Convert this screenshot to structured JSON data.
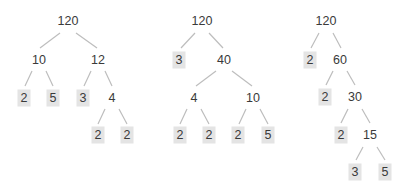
{
  "diagram": {
    "title": "",
    "leaf_box_color": "#e4e4e4",
    "edge_color": "#bdbdbd",
    "text_color": "#3a3a3a",
    "trees": [
      {
        "id": "tree-1",
        "nodes": [
          {
            "id": "t1n0",
            "label": "120",
            "x": 68,
            "y": 21,
            "leaf": false
          },
          {
            "id": "t1n1",
            "label": "10",
            "x": 39,
            "y": 60,
            "leaf": false
          },
          {
            "id": "t1n2",
            "label": "12",
            "x": 98,
            "y": 60,
            "leaf": false
          },
          {
            "id": "t1n3",
            "label": "2",
            "x": 24,
            "y": 98,
            "leaf": true
          },
          {
            "id": "t1n4",
            "label": "5",
            "x": 53,
            "y": 98,
            "leaf": true
          },
          {
            "id": "t1n5",
            "label": "3",
            "x": 83,
            "y": 98,
            "leaf": true
          },
          {
            "id": "t1n6",
            "label": "4",
            "x": 112,
            "y": 98,
            "leaf": false
          },
          {
            "id": "t1n7",
            "label": "2",
            "x": 98,
            "y": 135,
            "leaf": true
          },
          {
            "id": "t1n8",
            "label": "2",
            "x": 127,
            "y": 135,
            "leaf": true
          }
        ],
        "edges": [
          [
            60,
            33,
            40,
            48
          ],
          [
            76,
            33,
            97,
            48
          ],
          [
            32,
            71,
            25,
            86
          ],
          [
            46,
            71,
            53,
            86
          ],
          [
            91,
            71,
            84,
            86
          ],
          [
            105,
            71,
            112,
            86
          ],
          [
            105,
            109,
            98,
            124
          ],
          [
            119,
            109,
            127,
            124
          ]
        ]
      },
      {
        "id": "tree-2",
        "nodes": [
          {
            "id": "t2n0",
            "label": "120",
            "x": 202,
            "y": 21,
            "leaf": false
          },
          {
            "id": "t2n1",
            "label": "3",
            "x": 179,
            "y": 60,
            "leaf": true
          },
          {
            "id": "t2n2",
            "label": "40",
            "x": 224,
            "y": 60,
            "leaf": false
          },
          {
            "id": "t2n3",
            "label": "4",
            "x": 194,
            "y": 98,
            "leaf": false
          },
          {
            "id": "t2n4",
            "label": "10",
            "x": 253,
            "y": 98,
            "leaf": false
          },
          {
            "id": "t2n5",
            "label": "2",
            "x": 180,
            "y": 135,
            "leaf": true
          },
          {
            "id": "t2n6",
            "label": "2",
            "x": 209,
            "y": 135,
            "leaf": true
          },
          {
            "id": "t2n7",
            "label": "2",
            "x": 238,
            "y": 135,
            "leaf": true
          },
          {
            "id": "t2n8",
            "label": "5",
            "x": 268,
            "y": 135,
            "leaf": true
          }
        ],
        "edges": [
          [
            195,
            33,
            181,
            48
          ],
          [
            209,
            33,
            223,
            48
          ],
          [
            216,
            71,
            196,
            86
          ],
          [
            232,
            71,
            252,
            86
          ],
          [
            187,
            109,
            180,
            124
          ],
          [
            201,
            109,
            209,
            124
          ],
          [
            246,
            109,
            239,
            124
          ],
          [
            260,
            109,
            268,
            124
          ]
        ]
      },
      {
        "id": "tree-3",
        "nodes": [
          {
            "id": "t3n0",
            "label": "120",
            "x": 326,
            "y": 21,
            "leaf": false
          },
          {
            "id": "t3n1",
            "label": "2",
            "x": 310,
            "y": 60,
            "leaf": true
          },
          {
            "id": "t3n2",
            "label": "60",
            "x": 340,
            "y": 60,
            "leaf": false
          },
          {
            "id": "t3n3",
            "label": "2",
            "x": 325,
            "y": 97,
            "leaf": true
          },
          {
            "id": "t3n4",
            "label": "30",
            "x": 355,
            "y": 97,
            "leaf": false
          },
          {
            "id": "t3n5",
            "label": "2",
            "x": 341,
            "y": 135,
            "leaf": true
          },
          {
            "id": "t3n6",
            "label": "15",
            "x": 370,
            "y": 135,
            "leaf": false
          },
          {
            "id": "t3n7",
            "label": "3",
            "x": 355,
            "y": 172,
            "leaf": true
          },
          {
            "id": "t3n8",
            "label": "5",
            "x": 385,
            "y": 172,
            "leaf": true
          }
        ],
        "edges": [
          [
            319,
            33,
            311,
            48
          ],
          [
            333,
            33,
            341,
            48
          ],
          [
            333,
            71,
            326,
            85
          ],
          [
            347,
            71,
            355,
            85
          ],
          [
            348,
            109,
            341,
            123
          ],
          [
            362,
            109,
            370,
            123
          ],
          [
            363,
            147,
            356,
            160
          ],
          [
            377,
            147,
            385,
            160
          ]
        ]
      }
    ]
  }
}
